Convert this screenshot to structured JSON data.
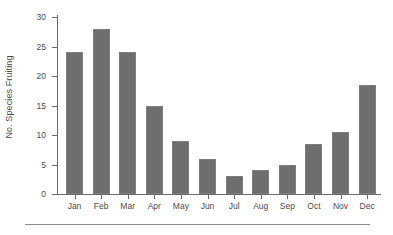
{
  "chart_data": {
    "type": "bar",
    "title": "",
    "xlabel": "",
    "ylabel": "No. Species Fruiting",
    "categories": [
      "Jan",
      "Feb",
      "Mar",
      "Apr",
      "May",
      "Jun",
      "Jul",
      "Aug",
      "Sep",
      "Oct",
      "Nov",
      "Dec"
    ],
    "values": [
      24,
      28,
      24,
      15,
      9,
      6,
      3,
      4,
      5,
      8.5,
      10.5,
      18.5
    ],
    "series": [
      {
        "name": "No. Species Fruiting",
        "values": [
          24,
          28,
          24,
          15,
          9,
          6,
          3,
          4,
          5,
          8.5,
          10.5,
          18.5
        ]
      }
    ],
    "ylim": [
      0,
      30
    ],
    "yticks": [
      0,
      5,
      10,
      15,
      20,
      25,
      30
    ],
    "ytick_labels": [
      "0",
      "5",
      "10",
      "15",
      "20",
      "25",
      "30"
    ],
    "grid": false,
    "legend": false,
    "legend_position": "none",
    "bar_color": "#6e6e6e",
    "axis_color": "#6b6b6b",
    "text_color": "#4a4a4a"
  }
}
